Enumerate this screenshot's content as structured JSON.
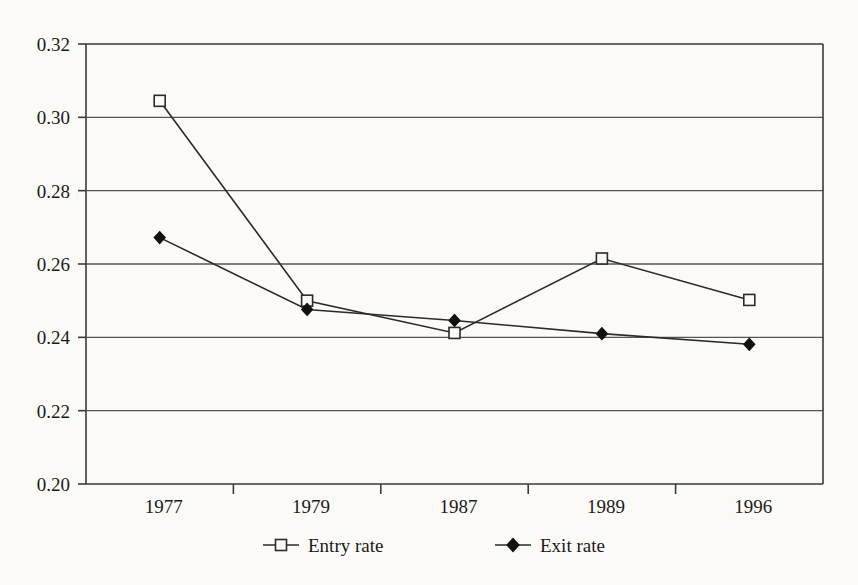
{
  "chart_data": {
    "type": "line",
    "title": "",
    "subtitle": "",
    "xlabel": "",
    "ylabel": "",
    "categories": [
      "1977",
      "1979",
      "1987",
      "1989",
      "1996"
    ],
    "series": [
      {
        "name": "Entry rate",
        "marker": "open-square",
        "values": [
          0.3045,
          0.25,
          0.2412,
          0.2615,
          0.2502
        ]
      },
      {
        "name": "Exit rate",
        "marker": "filled-diamond",
        "values": [
          0.2672,
          0.2476,
          0.2446,
          0.241,
          0.2381
        ]
      }
    ],
    "ylim": [
      0.2,
      0.32
    ],
    "yticks": [
      "0.20",
      "0.22",
      "0.24",
      "0.26",
      "0.28",
      "0.30",
      "0.32"
    ],
    "ytick_values": [
      0.2,
      0.22,
      0.24,
      0.26,
      0.28,
      0.3,
      0.32
    ],
    "grid": true,
    "grid_axis": "y",
    "legend_position": "bottom",
    "legend": [
      "Entry rate",
      "Exit rate"
    ],
    "colors": {
      "line": "#2b2b2b",
      "grid": "#555555",
      "frame": "#3a3a3a",
      "background": "#fbfaf7",
      "text": "#1a1a1a"
    }
  },
  "axis": {
    "y_labels": [
      "0.32",
      "0.30",
      "0.28",
      "0.26",
      "0.24",
      "0.22",
      "0.20"
    ],
    "x_labels": [
      "1977",
      "1979",
      "1987",
      "1989",
      "1996"
    ]
  },
  "legend": {
    "entries": [
      {
        "label": "Entry rate",
        "marker": "open-square"
      },
      {
        "label": "Exit rate",
        "marker": "filled-diamond"
      }
    ]
  }
}
